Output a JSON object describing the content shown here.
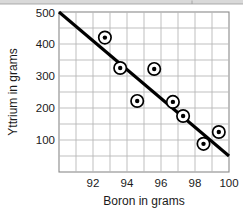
{
  "chart_data": {
    "type": "scatter",
    "title": "",
    "xlabel": "Boron in grams",
    "ylabel": "Yttrium in grams",
    "xlim": [
      90,
      100
    ],
    "ylim": [
      0,
      500
    ],
    "xticks": [
      92,
      94,
      96,
      98,
      100
    ],
    "yticks": [
      100,
      200,
      300,
      400,
      500
    ],
    "grid": true,
    "legend": false,
    "x": [
      92.7,
      93.6,
      94.6,
      95.6,
      96.7,
      97.3,
      98.5,
      99.4
    ],
    "y": [
      420,
      325,
      222,
      322,
      219,
      175,
      88,
      125
    ],
    "points": [
      {
        "x": 92.7,
        "y": 420
      },
      {
        "x": 93.6,
        "y": 325
      },
      {
        "x": 94.6,
        "y": 222
      },
      {
        "x": 95.6,
        "y": 322
      },
      {
        "x": 96.7,
        "y": 219
      },
      {
        "x": 97.3,
        "y": 175
      },
      {
        "x": 98.5,
        "y": 88
      },
      {
        "x": 99.4,
        "y": 125
      }
    ],
    "marker": "circled-dot",
    "trend_line": {
      "label": "line of best fit",
      "x1": 90.0,
      "y1": 500,
      "x2": 100.0,
      "y2": 50
    },
    "colors": {
      "line": "#000000",
      "marker_fill": "#ffffff",
      "marker_edge": "#000000",
      "grid": "#b8b8b8",
      "frame": "#8a8a8a",
      "background": "#ffffff"
    }
  },
  "axes": {
    "x_tick_labels": [
      "92",
      "94",
      "96",
      "98",
      "100"
    ],
    "y_tick_labels": [
      "100",
      "200",
      "300",
      "400",
      "500"
    ],
    "x_axis_title": "Boron in grams",
    "y_axis_title": "Yttrium in grams"
  }
}
